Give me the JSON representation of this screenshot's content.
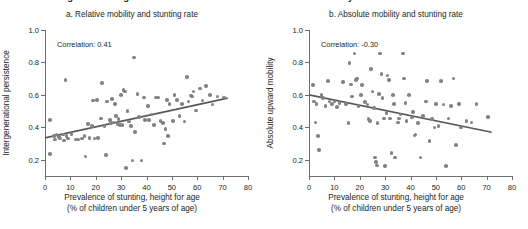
{
  "figure": {
    "title": "FIGURE O.5   Higher stunting rates are associated with lower rates of mobility"
  },
  "axis_common": {
    "xlabel_line1": "Prevalence of stunting, height for age",
    "xlabel_line2": "(% of children under 5 years of age)",
    "x_ticks": [
      "0",
      "10",
      "20",
      "30",
      "40",
      "50",
      "60",
      "70",
      "80"
    ],
    "y_ticks": [
      "0.2",
      "0.4",
      "0.6",
      "0.8",
      "1.0"
    ],
    "colors": {
      "dot": "#808285",
      "trend": "#58595b",
      "axis": "#6d6e71",
      "text": "#231f20"
    }
  },
  "chart_data": [
    {
      "type": "scatter",
      "panel": "a",
      "title": "a. Relative mobility and stunting rate",
      "annotation": "Correlation: 0.41",
      "correlation": 0.41,
      "xlabel": "Prevalence of stunting, height for age (% of children under 5 years of age)",
      "ylabel": "Intergenerational persistence",
      "xlim": [
        0,
        80
      ],
      "ylim": [
        0.1,
        1.0
      ],
      "grid": false,
      "legend": "none",
      "trendline": {
        "x": [
          0,
          72
        ],
        "y": [
          0.335,
          0.58
        ]
      },
      "points": [
        [
          2.0,
          0.445
        ],
        [
          2.0,
          0.235
        ],
        [
          3.5,
          0.345
        ],
        [
          4.0,
          0.325
        ],
        [
          4.5,
          0.355
        ],
        [
          5.5,
          0.34
        ],
        [
          6.0,
          0.33
        ],
        [
          7.0,
          0.355
        ],
        [
          7.5,
          0.32
        ],
        [
          8.0,
          0.69
        ],
        [
          8.5,
          0.345
        ],
        [
          9.0,
          0.33
        ],
        [
          10.5,
          0.36
        ],
        [
          12.0,
          0.325
        ],
        [
          13.0,
          0.325
        ],
        [
          14.5,
          0.33
        ],
        [
          15.5,
          0.345
        ],
        [
          16.0,
          0.22
        ],
        [
          17.0,
          0.42
        ],
        [
          17.5,
          0.335
        ],
        [
          18.5,
          0.41
        ],
        [
          19.0,
          0.565
        ],
        [
          19.5,
          0.33
        ],
        [
          20.5,
          0.57
        ],
        [
          21.0,
          0.335
        ],
        [
          22.0,
          0.455
        ],
        [
          22.5,
          0.675
        ],
        [
          23.5,
          0.41
        ],
        [
          24.0,
          0.23
        ],
        [
          24.5,
          0.56
        ],
        [
          25.5,
          0.445
        ],
        [
          26.0,
          0.425
        ],
        [
          26.5,
          0.575
        ],
        [
          27.0,
          0.43
        ],
        [
          27.5,
          0.545
        ],
        [
          28.0,
          0.47
        ],
        [
          28.5,
          0.42
        ],
        [
          29.0,
          0.45
        ],
        [
          29.5,
          0.415
        ],
        [
          30.0,
          0.6
        ],
        [
          30.5,
          0.415
        ],
        [
          31.0,
          0.63
        ],
        [
          31.5,
          0.62
        ],
        [
          32.0,
          0.15
        ],
        [
          32.5,
          0.5
        ],
        [
          33.0,
          0.435
        ],
        [
          34.0,
          0.41
        ],
        [
          34.5,
          0.195
        ],
        [
          35.0,
          0.83
        ],
        [
          35.5,
          0.37
        ],
        [
          36.5,
          0.605
        ],
        [
          37.0,
          0.465
        ],
        [
          38.0,
          0.195
        ],
        [
          39.0,
          0.585
        ],
        [
          39.5,
          0.445
        ],
        [
          40.5,
          0.53
        ],
        [
          41.0,
          0.445
        ],
        [
          42.0,
          0.48
        ],
        [
          43.0,
          0.415
        ],
        [
          43.5,
          0.585
        ],
        [
          44.5,
          0.585
        ],
        [
          45.5,
          0.44
        ],
        [
          46.5,
          0.425
        ],
        [
          47.0,
          0.3
        ],
        [
          47.5,
          0.39
        ],
        [
          48.0,
          0.57
        ],
        [
          48.5,
          0.345
        ],
        [
          49.0,
          0.545
        ],
        [
          50.5,
          0.44
        ],
        [
          51.0,
          0.6
        ],
        [
          52.0,
          0.57
        ],
        [
          53.0,
          0.47
        ],
        [
          54.0,
          0.545
        ],
        [
          55.0,
          0.435
        ],
        [
          56.0,
          0.71
        ],
        [
          56.5,
          0.56
        ],
        [
          57.5,
          0.595
        ],
        [
          58.0,
          0.59
        ],
        [
          58.5,
          0.62
        ],
        [
          59.5,
          0.505
        ],
        [
          61.0,
          0.64
        ],
        [
          62.0,
          0.565
        ],
        [
          63.5,
          0.655
        ],
        [
          65.0,
          0.6
        ],
        [
          66.0,
          0.54
        ],
        [
          68.0,
          0.59
        ],
        [
          70.5,
          0.585
        ]
      ]
    },
    {
      "type": "scatter",
      "panel": "b",
      "title": "b. Absolute mobility and stunting rate",
      "annotation": "Correlation: -0.30",
      "correlation": -0.3,
      "xlabel": "Prevalence of stunting, height for age (% of children under 5 years of age)",
      "ylabel": "Absolute upward mobility",
      "xlim": [
        0,
        80
      ],
      "ylim": [
        0.1,
        1.0
      ],
      "grid": false,
      "legend": "none",
      "trendline": {
        "x": [
          0,
          72
        ],
        "y": [
          0.6,
          0.37
        ]
      },
      "points": [
        [
          1.5,
          0.66
        ],
        [
          2.0,
          0.56
        ],
        [
          2.5,
          0.43
        ],
        [
          3.0,
          0.545
        ],
        [
          3.5,
          0.345
        ],
        [
          4.0,
          0.26
        ],
        [
          5.0,
          0.6
        ],
        [
          5.5,
          0.58
        ],
        [
          6.5,
          0.53
        ],
        [
          7.5,
          0.685
        ],
        [
          8.0,
          0.56
        ],
        [
          9.0,
          0.545
        ],
        [
          10.0,
          0.56
        ],
        [
          11.0,
          0.525
        ],
        [
          12.0,
          0.55
        ],
        [
          13.5,
          0.68
        ],
        [
          14.5,
          0.545
        ],
        [
          15.5,
          0.425
        ],
        [
          16.0,
          0.795
        ],
        [
          16.5,
          0.665
        ],
        [
          17.0,
          0.59
        ],
        [
          18.0,
          0.855
        ],
        [
          18.5,
          0.69
        ],
        [
          19.0,
          0.7
        ],
        [
          19.5,
          0.53
        ],
        [
          20.5,
          0.6
        ],
        [
          21.0,
          0.66
        ],
        [
          22.0,
          0.555
        ],
        [
          23.0,
          0.54
        ],
        [
          23.5,
          0.45
        ],
        [
          24.0,
          0.44
        ],
        [
          24.5,
          0.76
        ],
        [
          25.0,
          0.62
        ],
        [
          25.5,
          0.52
        ],
        [
          26.0,
          0.215
        ],
        [
          26.5,
          0.185
        ],
        [
          26.8,
          0.165
        ],
        [
          27.0,
          0.425
        ],
        [
          27.5,
          0.605
        ],
        [
          28.0,
          0.855
        ],
        [
          28.5,
          0.73
        ],
        [
          29.0,
          0.58
        ],
        [
          29.5,
          0.455
        ],
        [
          30.0,
          0.16
        ],
        [
          30.5,
          0.49
        ],
        [
          31.0,
          0.72
        ],
        [
          31.5,
          0.69
        ],
        [
          32.0,
          0.455
        ],
        [
          32.5,
          0.24
        ],
        [
          33.0,
          0.6
        ],
        [
          33.5,
          0.545
        ],
        [
          34.0,
          0.215
        ],
        [
          35.0,
          0.43
        ],
        [
          35.5,
          0.455
        ],
        [
          36.0,
          0.48
        ],
        [
          37.0,
          0.855
        ],
        [
          37.5,
          0.7
        ],
        [
          38.0,
          0.55
        ],
        [
          38.5,
          0.44
        ],
        [
          39.5,
          0.6
        ],
        [
          40.5,
          0.46
        ],
        [
          41.0,
          0.495
        ],
        [
          41.5,
          0.35
        ],
        [
          42.0,
          0.355
        ],
        [
          43.0,
          0.425
        ],
        [
          44.0,
          0.215
        ],
        [
          45.0,
          0.47
        ],
        [
          46.0,
          0.56
        ],
        [
          46.5,
          0.685
        ],
        [
          47.5,
          0.315
        ],
        [
          48.5,
          0.45
        ],
        [
          49.5,
          0.4
        ],
        [
          50.0,
          0.545
        ],
        [
          51.0,
          0.41
        ],
        [
          52.0,
          0.685
        ],
        [
          53.0,
          0.54
        ],
        [
          54.0,
          0.16
        ],
        [
          55.0,
          0.455
        ],
        [
          56.0,
          0.53
        ],
        [
          57.0,
          0.7
        ],
        [
          58.0,
          0.29
        ],
        [
          59.0,
          0.545
        ],
        [
          60.0,
          0.4
        ],
        [
          62.0,
          0.44
        ],
        [
          64.0,
          0.43
        ],
        [
          66.0,
          0.545
        ],
        [
          70.5,
          0.465
        ]
      ]
    }
  ]
}
